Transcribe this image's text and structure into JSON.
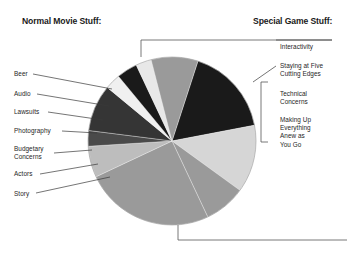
{
  "headers": {
    "left": "Normal Movie Stuff:",
    "right": "Special Game Stuff:"
  },
  "labels_left": [
    {
      "text": "Beer",
      "x": 14,
      "y": 70,
      "line": [
        [
          33,
          74
        ],
        [
          112,
          89
        ]
      ]
    },
    {
      "text": "Audio",
      "x": 14,
      "y": 90,
      "line": [
        [
          37,
          94
        ],
        [
          109,
          106
        ]
      ]
    },
    {
      "text": "Lawsuits",
      "x": 14,
      "y": 108,
      "line": [
        [
          48,
          112
        ],
        [
          103,
          120
        ]
      ]
    },
    {
      "text": "Photography",
      "x": 14,
      "y": 127,
      "line": [
        [
          62,
          131
        ],
        [
          97,
          133
        ]
      ]
    },
    {
      "text": "Budgetary\nConcerns",
      "x": 14,
      "y": 145,
      "line": [
        [
          54,
          153
        ],
        [
          92,
          150
        ]
      ]
    },
    {
      "text": "Actors",
      "x": 14,
      "y": 170,
      "line": [
        [
          40,
          174
        ],
        [
          98,
          164
        ]
      ]
    },
    {
      "text": "Story",
      "x": 14,
      "y": 190,
      "line": [
        [
          36,
          193
        ],
        [
          110,
          177
        ]
      ]
    }
  ],
  "labels_right": [
    {
      "text": "Interactivity",
      "x": 280,
      "y": 43
    },
    {
      "text": "Staying at Five\nCutting Edges",
      "x": 280,
      "y": 62
    },
    {
      "text": "Technical\nConcerns",
      "x": 280,
      "y": 90
    },
    {
      "text": "Making Up\nEverything\nAnew as\nYou Go",
      "x": 280,
      "y": 116
    }
  ],
  "chart_data": {
    "type": "pie",
    "center": [
      172,
      141
    ],
    "radius": 84,
    "start_angle": -72,
    "legend": "leader-line callouts",
    "grid": false,
    "categories": [
      "Interactivity",
      "Staying at Five Cutting Edges",
      "Technical Concerns",
      "Making Up Everything Anew as You Go",
      "Story",
      "Actors",
      "Budgetary Concerns",
      "Photography",
      "Lawsuits",
      "Audio",
      "Beer"
    ],
    "values": [
      17,
      13,
      8,
      25,
      6,
      3,
      9,
      3,
      4,
      3,
      9
    ],
    "colors": [
      "#1a1a1a",
      "#d6d6d6",
      "#9a9a9a",
      "#9a9a9a",
      "#bdbdbd",
      "#4a4a4a",
      "#353535",
      "#f0f0f0",
      "#1a1a1a",
      "#e8e8e8",
      "#9a9a9a"
    ],
    "group_left": "Normal Movie Stuff",
    "group_right": "Special Game Stuff"
  },
  "brackets": {
    "top": {
      "points": [
        [
          141,
          57
        ],
        [
          141,
          40
        ],
        [
          332,
          40
        ]
      ]
    },
    "bottom": {
      "points": [
        [
          178,
          225
        ],
        [
          178,
          240
        ],
        [
          347,
          240
        ]
      ]
    },
    "right_group": {
      "points": [
        [
          268,
          82
        ],
        [
          261,
          82
        ],
        [
          261,
          142
        ],
        [
          268,
          142
        ]
      ]
    },
    "leader_interactivity": [
      [
        332,
        40
      ],
      [
        276,
        40
      ]
    ],
    "leader_staying": [
      [
        253,
        82
      ],
      [
        276,
        66
      ]
    ]
  }
}
